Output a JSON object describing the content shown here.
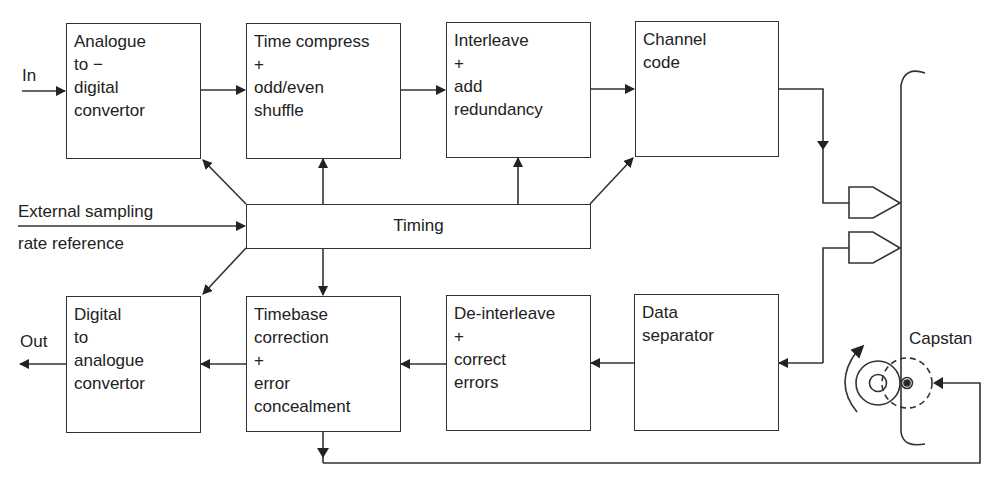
{
  "diagram": {
    "blocks": {
      "adc": {
        "label": "Analogue\nto −\ndigital\nconvertor"
      },
      "time_compress": {
        "label": "Time compress\n+\nodd/even\nshuffle"
      },
      "interleave": {
        "label": "Interleave\n+\nadd\nredundancy"
      },
      "channel_code": {
        "label": "Channel\ncode"
      },
      "timing": {
        "label": "Timing"
      },
      "dac": {
        "label": "Digital\nto\nanalogue\nconvertor"
      },
      "timebase": {
        "label": "Timebase\ncorrection\n+\nerror\nconcealment"
      },
      "deinterleave": {
        "label": "De-interleave\n+\ncorrect\nerrors"
      },
      "data_separator": {
        "label": "Data\nseparator"
      }
    },
    "labels": {
      "input": "In",
      "output": "Out",
      "external_ref_line1": "External sampling",
      "external_ref_line2": "rate reference",
      "capstan": "Capstan"
    },
    "colors": {
      "line": "#333333",
      "text": "#222222",
      "background": "#ffffff"
    }
  }
}
